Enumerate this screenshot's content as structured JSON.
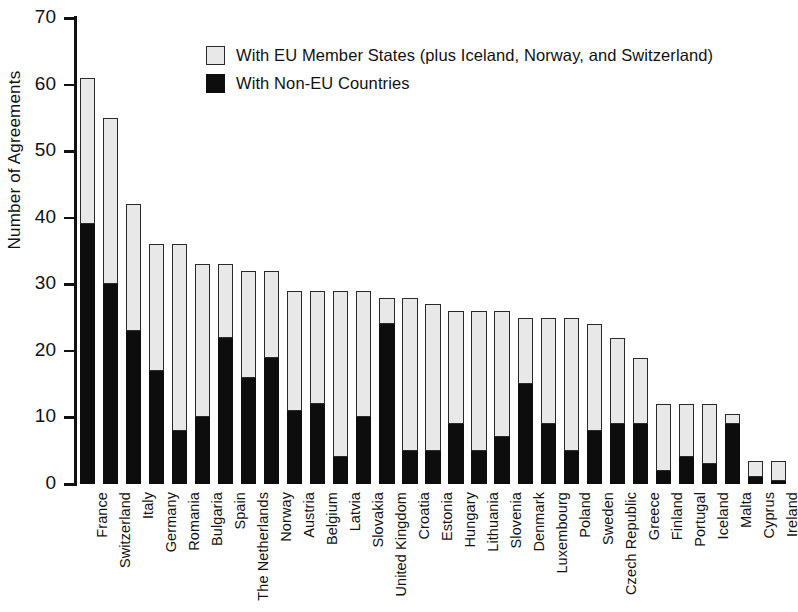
{
  "chart_data": {
    "type": "bar",
    "subtype": "stacked-vertical",
    "title": "",
    "xlabel": "",
    "ylabel": "Number of Agreements",
    "ylim": [
      0,
      70
    ],
    "ytick_interval": 10,
    "yticks": [
      "0",
      "10",
      "20",
      "30",
      "40",
      "50",
      "60",
      "70"
    ],
    "grid": false,
    "legend_position": "top-center-inside",
    "categories": [
      "France",
      "Switzerland",
      "Italy",
      "Germany",
      "Romania",
      "Bulgaria",
      "Spain",
      "The Netherlands",
      "Norway",
      "Austria",
      "Belgium",
      "Latvia",
      "Slovakia",
      "United Kingdom",
      "Croatia",
      "Estonia",
      "Hungary",
      "Lithuania",
      "Slovenia",
      "Denmark",
      "Luxembourg",
      "Poland",
      "Sweden",
      "Czech Republic",
      "Greece",
      "Finland",
      "Portugal",
      "Iceland",
      "Malta",
      "Cyprus",
      "Ireland"
    ],
    "series": [
      {
        "name": "With Non-EU Countries",
        "color": "#0d0d0d",
        "values": [
          39,
          30,
          23,
          17,
          8,
          10,
          22,
          16,
          19,
          11,
          12,
          4,
          10,
          24,
          5,
          5,
          9,
          5,
          7,
          15,
          9,
          5,
          8,
          9,
          9,
          2,
          4,
          3,
          9,
          1,
          0.5
        ]
      },
      {
        "name": "With EU Member States (plus Iceland, Norway, and Switzerland)",
        "color": "#e8e8e8",
        "values": [
          22,
          25,
          19,
          19,
          28,
          23,
          11,
          16,
          13,
          18,
          17,
          25,
          19,
          4,
          23,
          22,
          17,
          21,
          19,
          10,
          16,
          20,
          16,
          13,
          10,
          10,
          8,
          9,
          1.5,
          2.5,
          3
        ]
      }
    ],
    "totals": [
      61,
      55,
      42,
      36,
      36,
      33,
      33,
      32,
      32,
      29,
      29,
      29,
      29,
      28,
      28,
      27,
      26,
      26,
      26,
      25,
      25,
      25,
      24,
      22,
      19,
      12,
      12,
      12,
      10.5,
      3.5,
      3.5
    ]
  },
  "legend": {
    "items": [
      {
        "swatch": "eu",
        "label": "With EU Member States (plus Iceland, Norway, and Switzerland)"
      },
      {
        "swatch": "noneu",
        "label": "With Non-EU Countries"
      }
    ]
  },
  "axis": {
    "y_title": "Number of Agreements"
  }
}
